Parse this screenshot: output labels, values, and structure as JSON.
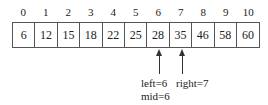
{
  "diagram": {
    "title": "",
    "indices": [
      "0",
      "1",
      "2",
      "3",
      "4",
      "5",
      "6",
      "7",
      "8",
      "9",
      "10"
    ],
    "values": [
      "6",
      "12",
      "15",
      "18",
      "22",
      "25",
      "28",
      "35",
      "46",
      "58",
      "60"
    ],
    "pointers": {
      "left_mid_arrow_index": 6,
      "right_arrow_index": 7,
      "left_label": "left=6",
      "mid_label": "mid=6",
      "right_label": "right=7"
    },
    "colors": {
      "line": "#555555",
      "text": "#222222",
      "background": "#ffffff"
    }
  }
}
